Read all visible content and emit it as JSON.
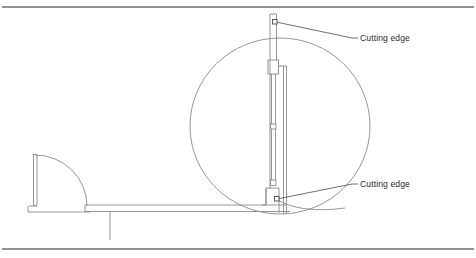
{
  "figure": {
    "kind": "technical-line-drawing",
    "background_color": "#ffffff",
    "line_color": "#8a8a8a",
    "leader_color": "#4a4a4a",
    "rule_color": "#6e6e6e",
    "text_color": "#2b2b2b",
    "width": 476,
    "height": 258
  },
  "rules": {
    "top": {
      "y": 7,
      "x1": 2,
      "x2": 474
    },
    "bottom": {
      "y": 249,
      "x1": 2,
      "x2": 474
    }
  },
  "callouts": [
    {
      "id": "cutting-edge-top",
      "label": "Cutting edge",
      "text_x": 358,
      "text_y": 41,
      "anchor_x": 275,
      "anchor_y": 22,
      "elbow_x": 352,
      "elbow_y": 38,
      "marker": "square-dot"
    },
    {
      "id": "cutting-edge-bottom",
      "label": "Cutting edge",
      "text_x": 358,
      "text_y": 187,
      "anchor_x": 276,
      "anchor_y": 199,
      "elbow_x": 352,
      "elbow_y": 184,
      "marker": "square-dot"
    }
  ],
  "geometry": {
    "swing_circle": {
      "name": "swing-radius-circle",
      "cx": 280,
      "cy": 126,
      "rx": 90,
      "ry": 88
    },
    "door_arc": {
      "name": "door-swing-arc",
      "hinge_x": 33,
      "hinge_y": 155,
      "end_x": 87,
      "end_y": 206,
      "radius": 53
    },
    "door_panel": {
      "name": "door-panel",
      "x": 33,
      "y_top": 154,
      "y_bottom": 206,
      "thickness": 3.5
    },
    "floor_beam": {
      "name": "floor-beam",
      "x1": 85,
      "x2": 286,
      "y_top": 205,
      "y_bottom": 211
    },
    "door_sill": {
      "name": "door-sill",
      "x1": 28,
      "x2": 90,
      "y": 212
    },
    "drop_tick": {
      "name": "floor-drop-tick",
      "x": 110,
      "y_top": 212,
      "y_bottom": 240
    },
    "mast": {
      "name": "vertical-mast",
      "x_left": 270,
      "x_right": 276,
      "y_top": 14,
      "y_bottom": 213
    },
    "inner_rod": {
      "name": "inner-rod",
      "x": 285,
      "y_top": 66,
      "y_bottom": 214
    },
    "upper_block": {
      "name": "upper-slider-block",
      "x": 268,
      "y": 60,
      "w": 10,
      "h": 14
    },
    "mid_joint": {
      "name": "mid-joint-marker",
      "x": 271,
      "y": 125,
      "w": 5,
      "h": 5
    },
    "lower_joint": {
      "name": "lower-joint-marker",
      "x": 271,
      "y": 181,
      "w": 5,
      "h": 5
    },
    "lower_block": {
      "name": "lower-carriage-block",
      "x": 266,
      "y": 188,
      "w": 12,
      "h": 24
    }
  }
}
